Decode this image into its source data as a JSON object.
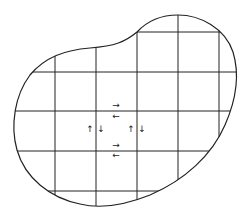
{
  "diagram": {
    "title": "",
    "colors": {
      "stroke": "#222222",
      "background": "#ffffff",
      "arrow": "#333333"
    },
    "grid": {
      "vertical_x": [
        55,
        96,
        137,
        178,
        219
      ],
      "horizontal_y": [
        32,
        72,
        111,
        151,
        191
      ]
    },
    "arrows": [
      {
        "glyph": "→",
        "x": 116,
        "y": 108,
        "position": "top edge, above line"
      },
      {
        "glyph": "←",
        "x": 116,
        "y": 119,
        "position": "top edge, below line"
      },
      {
        "glyph": "↑",
        "x": 90,
        "y": 132,
        "position": "left edge, left of line"
      },
      {
        "glyph": "↓",
        "x": 101,
        "y": 132,
        "position": "left edge, right of line"
      },
      {
        "glyph": "↑",
        "x": 131,
        "y": 132,
        "position": "right edge, left of line"
      },
      {
        "glyph": "↓",
        "x": 142,
        "y": 132,
        "position": "right edge, right of line"
      },
      {
        "glyph": "→",
        "x": 116,
        "y": 148,
        "position": "bottom edge, above line"
      },
      {
        "glyph": "←",
        "x": 116,
        "y": 158,
        "position": "bottom edge, below line"
      }
    ]
  }
}
